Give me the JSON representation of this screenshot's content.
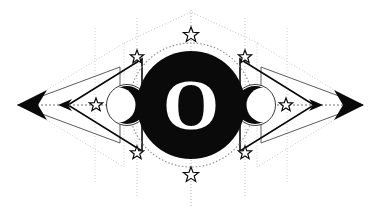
{
  "artwork": {
    "title": "Esoteric Emblem",
    "background_color": "#ffffff",
    "ink_color": "#0a0a0a",
    "guide_color": "#b9b9b9",
    "faint_color": "#d6d6d6",
    "canvas": {
      "width": 381,
      "height": 218
    },
    "center_glyph": {
      "character": "O",
      "color": "#ffffff",
      "font_size": 72,
      "x": 191,
      "y": 105
    },
    "central_disc": {
      "name": "black-circle",
      "cx": 191,
      "cy": 105,
      "r": 54,
      "fill": "#0a0a0a"
    },
    "dotted_halo": {
      "name": "dotted-circle",
      "cx": 191,
      "cy": 105,
      "r": 62,
      "stroke": "#8c8c8c"
    },
    "stars": [
      {
        "label": "star-top",
        "cx": 191,
        "cy": 35,
        "r": 8
      },
      {
        "label": "star-bottom",
        "cx": 191,
        "cy": 175,
        "r": 8
      },
      {
        "label": "star-upper-left",
        "cx": 137,
        "cy": 57,
        "r": 7
      },
      {
        "label": "star-upper-right",
        "cx": 245,
        "cy": 57,
        "r": 7
      },
      {
        "label": "star-lower-left",
        "cx": 137,
        "cy": 153,
        "r": 7
      },
      {
        "label": "star-lower-right",
        "cx": 245,
        "cy": 153,
        "r": 7
      },
      {
        "label": "star-inner-left",
        "cx": 96,
        "cy": 105,
        "r": 7
      },
      {
        "label": "star-inner-right",
        "cx": 286,
        "cy": 105,
        "r": 7
      }
    ],
    "crescents": [
      {
        "label": "crescent-left",
        "cx": 127,
        "cy": 105,
        "r": 19,
        "facing": "left"
      },
      {
        "label": "crescent-right",
        "cx": 255,
        "cy": 105,
        "r": 19,
        "facing": "right"
      }
    ],
    "triangles": [
      {
        "label": "solid-triangle-left",
        "apex_x": 68,
        "base_x": 142,
        "half_height": 46,
        "stroke": "#0a0a0a",
        "weight": 1.6
      },
      {
        "label": "solid-triangle-right",
        "apex_x": 314,
        "base_x": 240,
        "half_height": 46,
        "stroke": "#0a0a0a",
        "weight": 1.6
      },
      {
        "label": "faint-triangle-left",
        "apex_x": 22,
        "base_x": 124,
        "half_height": 62,
        "stroke": "#c9c9c9",
        "weight": 1.0
      },
      {
        "label": "faint-triangle-right",
        "apex_x": 359,
        "base_x": 257,
        "half_height": 62,
        "stroke": "#c9c9c9",
        "weight": 1.0
      },
      {
        "label": "outline-triangle-left",
        "apex_x": 18,
        "base_x": 120,
        "half_height": 38,
        "stroke": "#4a4a4a",
        "weight": 0.9
      },
      {
        "label": "outline-triangle-right",
        "apex_x": 363,
        "base_x": 261,
        "half_height": 38,
        "stroke": "#4a4a4a",
        "weight": 0.9
      }
    ],
    "arrowheads": [
      {
        "label": "arrowhead-outer-left",
        "tip_x": 17,
        "tail_x": 47,
        "half_height": 15,
        "fill": "#0a0a0a"
      },
      {
        "label": "arrowhead-outer-right",
        "tip_x": 364,
        "tail_x": 334,
        "half_height": 15,
        "fill": "#0a0a0a"
      },
      {
        "label": "arrowhead-mid-left",
        "tip_x": 58,
        "tail_x": 72,
        "half_height": 6,
        "fill": "#0a0a0a"
      },
      {
        "label": "arrowhead-mid-right",
        "tip_x": 323,
        "tail_x": 309,
        "half_height": 6,
        "fill": "#0a0a0a"
      }
    ],
    "axis_line": {
      "label": "horizontal-dotted-axis",
      "y": 105,
      "x1": 17,
      "x2": 364,
      "stroke": "#6e6e6e"
    },
    "vertical_guides": [
      {
        "label": "guide-far-left",
        "x": 95,
        "y1": 28,
        "y2": 182,
        "stroke": "#d0d0d0"
      },
      {
        "label": "guide-far-right",
        "x": 287,
        "y1": 28,
        "y2": 182,
        "stroke": "#d0d0d0"
      },
      {
        "label": "guide-mid-left",
        "x": 137,
        "y1": 18,
        "y2": 196,
        "stroke": "#c4c4c4"
      },
      {
        "label": "guide-mid-right",
        "x": 245,
        "y1": 18,
        "y2": 196,
        "stroke": "#c4c4c4"
      },
      {
        "label": "guide-center",
        "x": 191,
        "y1": 10,
        "y2": 208,
        "stroke": "#b0b0b0"
      }
    ],
    "diagonal_guides": [
      {
        "label": "diagonal-upper-left",
        "x1": 124,
        "y1": 43,
        "x2": 191,
        "y2": 12
      },
      {
        "label": "diagonal-upper-right",
        "x1": 258,
        "y1": 43,
        "x2": 191,
        "y2": 12
      }
    ]
  }
}
